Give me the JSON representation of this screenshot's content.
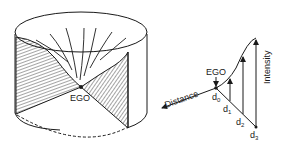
{
  "figure": {
    "left_panel": {
      "label": "EGO"
    },
    "right_panel": {
      "ego_label": "EGO",
      "x_axis_label": "Distance",
      "y_axis_label": "Intensity",
      "distance_marks": [
        "d",
        "d",
        "d",
        "d"
      ],
      "distance_subscripts": [
        "0",
        "1",
        "2",
        "3"
      ]
    },
    "colors": {
      "ink": "#1a1a1a",
      "background": "#ffffff"
    }
  }
}
